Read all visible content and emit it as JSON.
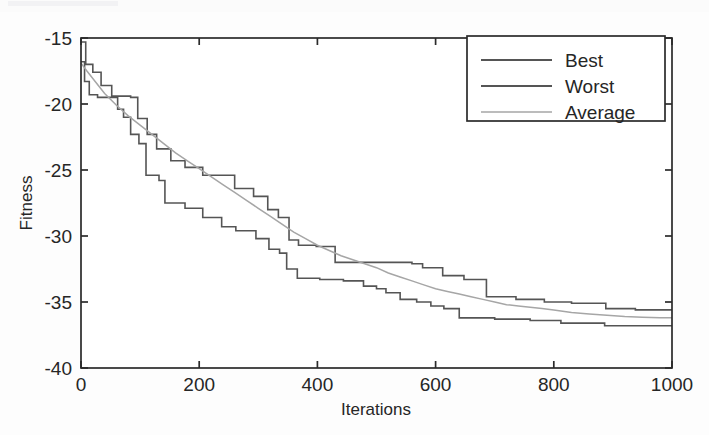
{
  "figure": {
    "background_color": "#fdfdfd",
    "axes_color": "#2b2b2b"
  },
  "chart_data": {
    "type": "line",
    "title": "",
    "xlabel": "Iterations",
    "ylabel": "Fitness",
    "xlim": [
      0,
      1000
    ],
    "ylim": [
      -40,
      -15
    ],
    "xticks": [
      0,
      200,
      400,
      600,
      800,
      1000
    ],
    "yticks": [
      -15,
      -20,
      -25,
      -30,
      -35,
      -40
    ],
    "xtick_labels": [
      "0",
      "200",
      "400",
      "600",
      "800",
      "1000"
    ],
    "ytick_labels": [
      "-15",
      "-20",
      "-25",
      "-30",
      "-35",
      "-40"
    ],
    "grid": false,
    "legend_position": "upper right",
    "legend_entries": [
      "Best",
      "Worst",
      "Average"
    ],
    "series": [
      {
        "name": "Worst",
        "color": "#555555",
        "style": "step",
        "width": 1.6,
        "points": [
          [
            0,
            -15.3
          ],
          [
            8,
            -15.3
          ],
          [
            8,
            -17.0
          ],
          [
            20,
            -17.0
          ],
          [
            20,
            -17.6
          ],
          [
            34,
            -17.6
          ],
          [
            34,
            -18.6
          ],
          [
            52,
            -18.6
          ],
          [
            52,
            -19.4
          ],
          [
            84,
            -19.4
          ],
          [
            84,
            -19.5
          ],
          [
            96,
            -19.5
          ],
          [
            96,
            -21.1
          ],
          [
            112,
            -21.1
          ],
          [
            112,
            -22.3
          ],
          [
            128,
            -22.3
          ],
          [
            128,
            -23.4
          ],
          [
            152,
            -23.4
          ],
          [
            152,
            -24.3
          ],
          [
            176,
            -24.3
          ],
          [
            176,
            -24.8
          ],
          [
            206,
            -24.8
          ],
          [
            206,
            -25.4
          ],
          [
            260,
            -25.4
          ],
          [
            260,
            -26.4
          ],
          [
            292,
            -26.4
          ],
          [
            292,
            -27.0
          ],
          [
            316,
            -27.0
          ],
          [
            316,
            -28.0
          ],
          [
            334,
            -28.0
          ],
          [
            334,
            -28.6
          ],
          [
            352,
            -28.6
          ],
          [
            352,
            -30.3
          ],
          [
            368,
            -30.3
          ],
          [
            368,
            -30.7
          ],
          [
            398,
            -30.7
          ],
          [
            398,
            -30.8
          ],
          [
            430,
            -30.8
          ],
          [
            430,
            -32.0
          ],
          [
            560,
            -32.0
          ],
          [
            560,
            -32.1
          ],
          [
            578,
            -32.1
          ],
          [
            578,
            -32.4
          ],
          [
            612,
            -32.4
          ],
          [
            612,
            -33.0
          ],
          [
            648,
            -33.0
          ],
          [
            648,
            -33.3
          ],
          [
            686,
            -33.3
          ],
          [
            686,
            -34.6
          ],
          [
            736,
            -34.6
          ],
          [
            736,
            -34.8
          ],
          [
            784,
            -34.8
          ],
          [
            784,
            -35.0
          ],
          [
            830,
            -35.0
          ],
          [
            830,
            -35.1
          ],
          [
            888,
            -35.1
          ],
          [
            888,
            -35.5
          ],
          [
            938,
            -35.5
          ],
          [
            938,
            -35.6
          ],
          [
            1000,
            -35.6
          ]
        ]
      },
      {
        "name": "Best",
        "color": "#555555",
        "style": "step",
        "width": 1.6,
        "points": [
          [
            0,
            -16.8
          ],
          [
            6,
            -16.8
          ],
          [
            6,
            -18.3
          ],
          [
            14,
            -18.3
          ],
          [
            14,
            -19.3
          ],
          [
            28,
            -19.3
          ],
          [
            28,
            -19.5
          ],
          [
            62,
            -19.5
          ],
          [
            62,
            -20.4
          ],
          [
            72,
            -20.4
          ],
          [
            72,
            -21.0
          ],
          [
            84,
            -21.0
          ],
          [
            84,
            -22.3
          ],
          [
            98,
            -22.3
          ],
          [
            98,
            -23.0
          ],
          [
            110,
            -23.0
          ],
          [
            110,
            -25.4
          ],
          [
            132,
            -25.4
          ],
          [
            132,
            -25.8
          ],
          [
            142,
            -25.8
          ],
          [
            142,
            -27.5
          ],
          [
            176,
            -27.5
          ],
          [
            176,
            -27.9
          ],
          [
            206,
            -27.9
          ],
          [
            206,
            -28.6
          ],
          [
            238,
            -28.6
          ],
          [
            238,
            -29.3
          ],
          [
            262,
            -29.3
          ],
          [
            262,
            -29.6
          ],
          [
            296,
            -29.6
          ],
          [
            296,
            -30.2
          ],
          [
            318,
            -30.2
          ],
          [
            318,
            -31.0
          ],
          [
            336,
            -31.0
          ],
          [
            336,
            -31.3
          ],
          [
            348,
            -31.3
          ],
          [
            348,
            -32.5
          ],
          [
            366,
            -32.5
          ],
          [
            366,
            -33.2
          ],
          [
            404,
            -33.2
          ],
          [
            404,
            -33.3
          ],
          [
            444,
            -33.3
          ],
          [
            444,
            -33.4
          ],
          [
            478,
            -33.4
          ],
          [
            478,
            -33.8
          ],
          [
            500,
            -33.8
          ],
          [
            500,
            -34.0
          ],
          [
            516,
            -34.0
          ],
          [
            516,
            -34.3
          ],
          [
            540,
            -34.3
          ],
          [
            540,
            -34.8
          ],
          [
            568,
            -34.8
          ],
          [
            568,
            -35.0
          ],
          [
            592,
            -35.0
          ],
          [
            592,
            -35.3
          ],
          [
            614,
            -35.3
          ],
          [
            614,
            -35.5
          ],
          [
            640,
            -35.5
          ],
          [
            640,
            -36.2
          ],
          [
            700,
            -36.2
          ],
          [
            700,
            -36.3
          ],
          [
            760,
            -36.3
          ],
          [
            760,
            -36.4
          ],
          [
            812,
            -36.4
          ],
          [
            812,
            -36.6
          ],
          [
            886,
            -36.6
          ],
          [
            886,
            -36.8
          ],
          [
            1000,
            -36.8
          ]
        ]
      },
      {
        "name": "Average",
        "color": "#a6a6a6",
        "style": "smooth",
        "width": 1.5,
        "points": [
          [
            0,
            -16.9
          ],
          [
            10,
            -17.5
          ],
          [
            24,
            -18.3
          ],
          [
            40,
            -19.2
          ],
          [
            60,
            -20.1
          ],
          [
            80,
            -20.9
          ],
          [
            100,
            -21.6
          ],
          [
            120,
            -22.3
          ],
          [
            140,
            -23.0
          ],
          [
            160,
            -23.7
          ],
          [
            180,
            -24.3
          ],
          [
            200,
            -24.9
          ],
          [
            220,
            -25.5
          ],
          [
            240,
            -26.1
          ],
          [
            260,
            -26.7
          ],
          [
            280,
            -27.3
          ],
          [
            300,
            -27.9
          ],
          [
            320,
            -28.5
          ],
          [
            340,
            -29.1
          ],
          [
            360,
            -29.7
          ],
          [
            380,
            -30.2
          ],
          [
            400,
            -30.7
          ],
          [
            420,
            -31.1
          ],
          [
            440,
            -31.5
          ],
          [
            460,
            -31.8
          ],
          [
            480,
            -32.1
          ],
          [
            500,
            -32.4
          ],
          [
            520,
            -32.8
          ],
          [
            540,
            -33.1
          ],
          [
            560,
            -33.4
          ],
          [
            580,
            -33.7
          ],
          [
            600,
            -34.0
          ],
          [
            620,
            -34.2
          ],
          [
            640,
            -34.4
          ],
          [
            660,
            -34.6
          ],
          [
            680,
            -34.8
          ],
          [
            700,
            -35.0
          ],
          [
            720,
            -35.2
          ],
          [
            740,
            -35.3
          ],
          [
            760,
            -35.4
          ],
          [
            780,
            -35.5
          ],
          [
            800,
            -35.6
          ],
          [
            830,
            -35.8
          ],
          [
            860,
            -35.9
          ],
          [
            890,
            -36.0
          ],
          [
            920,
            -36.1
          ],
          [
            950,
            -36.15
          ],
          [
            980,
            -36.2
          ],
          [
            1000,
            -36.2
          ]
        ]
      }
    ]
  }
}
